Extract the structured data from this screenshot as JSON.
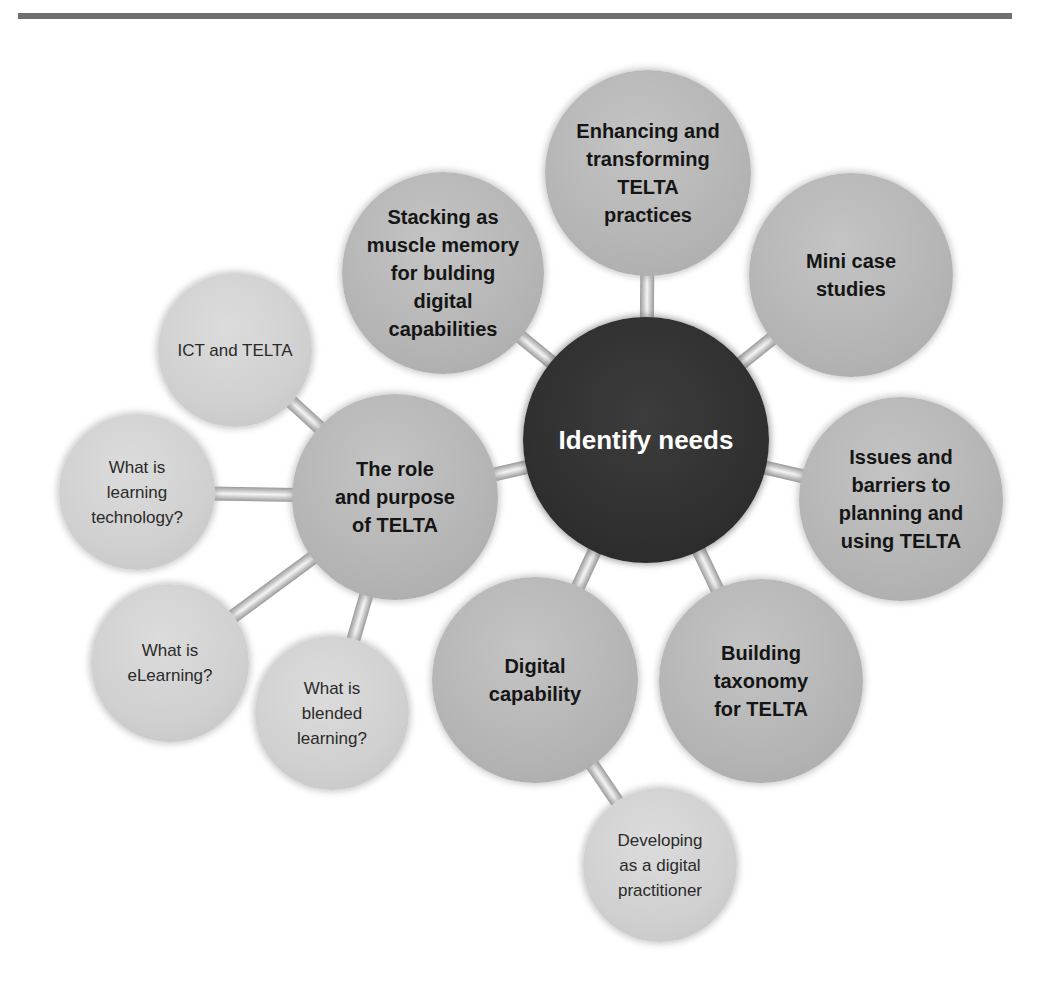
{
  "diagram": {
    "type": "mind-map",
    "center": {
      "id": "hub",
      "label": "Identify needs",
      "x": 646,
      "y": 440,
      "r": 123,
      "color": "#303030"
    },
    "nodes": [
      {
        "id": "enhancing",
        "label": "Enhancing and transforming TELTA practices",
        "lines": [
          "Enhancing and",
          "transforming",
          "TELTA",
          "practices"
        ],
        "x": 648,
        "y": 173,
        "r": 103,
        "level": 1,
        "parent": "hub"
      },
      {
        "id": "stacking",
        "label": "Stacking as muscle memory for bulding digital capabilities",
        "lines": [
          "Stacking as",
          "muscle memory",
          "for bulding",
          "digital",
          "capabilities"
        ],
        "x": 443,
        "y": 273,
        "r": 101,
        "level": 1,
        "parent": "hub"
      },
      {
        "id": "mini",
        "label": "Mini case studies",
        "lines": [
          "Mini case",
          "studies"
        ],
        "x": 851,
        "y": 275,
        "r": 102,
        "level": 1,
        "parent": "hub"
      },
      {
        "id": "issues",
        "label": "Issues and barriers to planning and using TELTA",
        "lines": [
          "Issues and",
          "barriers to",
          "planning and",
          "using TELTA"
        ],
        "x": 901,
        "y": 499,
        "r": 102,
        "level": 1,
        "parent": "hub"
      },
      {
        "id": "building",
        "label": "Building taxonomy for TELTA",
        "lines": [
          "Building",
          "taxonomy",
          "for TELTA"
        ],
        "x": 761,
        "y": 681,
        "r": 102,
        "level": 1,
        "parent": "hub"
      },
      {
        "id": "digital",
        "label": "Digital capability",
        "lines": [
          "Digital",
          "capability"
        ],
        "x": 535,
        "y": 680,
        "r": 103,
        "level": 1,
        "parent": "hub"
      },
      {
        "id": "role",
        "label": "The role and purpose of TELTA",
        "lines": [
          "The role",
          "and purpose",
          "of TELTA"
        ],
        "x": 395,
        "y": 497,
        "r": 103,
        "level": 1,
        "parent": "hub"
      },
      {
        "id": "ict",
        "label": "ICT and TELTA",
        "lines": [
          "ICT and TELTA"
        ],
        "x": 235,
        "y": 350,
        "r": 77,
        "level": 2,
        "parent": "role"
      },
      {
        "id": "learntech",
        "label": "What is learning technology?",
        "lines": [
          "What is",
          "learning",
          "technology?"
        ],
        "x": 137,
        "y": 492,
        "r": 78,
        "level": 2,
        "parent": "role"
      },
      {
        "id": "elearning",
        "label": "What is eLearning?",
        "lines": [
          "What is",
          "eLearning?"
        ],
        "x": 170,
        "y": 663,
        "r": 79,
        "level": 2,
        "parent": "role"
      },
      {
        "id": "blended",
        "label": "What is blended learning?",
        "lines": [
          "What is",
          "blended",
          "learning?"
        ],
        "x": 332,
        "y": 713,
        "r": 77,
        "level": 2,
        "parent": "role"
      },
      {
        "id": "developing",
        "label": "Developing as a digital practitioner",
        "lines": [
          "Developing",
          "as a digital",
          "practitioner"
        ],
        "x": 660,
        "y": 865,
        "r": 77,
        "level": 2,
        "parent": "digital"
      }
    ],
    "colors": {
      "hub": "#303030",
      "main_node": "#b6b6b6",
      "sub_node": "#d0d0d0",
      "connector": "#c8c8c8",
      "rule": "#6e6e6e"
    }
  }
}
